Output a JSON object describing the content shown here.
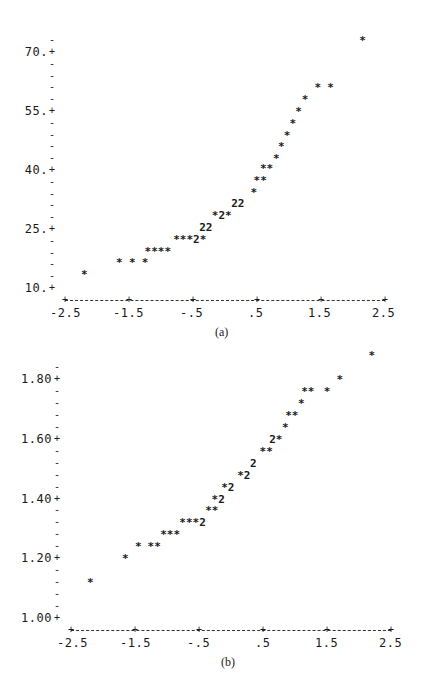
{
  "chart_data": [
    {
      "type": "scatter",
      "caption": "(a)",
      "title": "",
      "xlabel": "",
      "ylabel": "",
      "marker": "*",
      "x_ticks": [
        "-2.5",
        "-1.5",
        "-.5",
        ".5",
        "1.5",
        "2.5"
      ],
      "x_tick_values": [
        -2.5,
        -1.5,
        -0.5,
        0.5,
        1.5,
        2.5
      ],
      "y_ticks": [
        "70.",
        "55.",
        "40.",
        "25.",
        "10."
      ],
      "y_tick_values": [
        70,
        55,
        40,
        25,
        10
      ],
      "xlim": [
        -2.5,
        2.5
      ],
      "ylim": [
        7,
        76
      ],
      "grid": false,
      "legend": null,
      "note": "Character-plot (normal probability plot); '2' denotes two coincident points",
      "points": [
        {
          "x": -2.2,
          "y": 13.5,
          "glyph": "*"
        },
        {
          "x": -1.65,
          "y": 16.5,
          "glyph": "*"
        },
        {
          "x": -1.45,
          "y": 16.5,
          "glyph": "*"
        },
        {
          "x": -1.25,
          "y": 16.5,
          "glyph": "*"
        },
        {
          "x": -1.05,
          "y": 19.5,
          "glyph": "****"
        },
        {
          "x": -0.55,
          "y": 22.5,
          "glyph": "***2*"
        },
        {
          "x": -0.3,
          "y": 25.5,
          "glyph": "22"
        },
        {
          "x": -0.05,
          "y": 28.5,
          "glyph": "*2*"
        },
        {
          "x": 0.2,
          "y": 31.5,
          "glyph": "22"
        },
        {
          "x": 0.45,
          "y": 34.5,
          "glyph": "*"
        },
        {
          "x": 0.55,
          "y": 37.5,
          "glyph": "**"
        },
        {
          "x": 0.65,
          "y": 40.5,
          "glyph": "**"
        },
        {
          "x": 0.8,
          "y": 43.0,
          "glyph": "*"
        },
        {
          "x": 0.88,
          "y": 46.0,
          "glyph": "*"
        },
        {
          "x": 0.97,
          "y": 49.0,
          "glyph": "*"
        },
        {
          "x": 1.06,
          "y": 52.0,
          "glyph": "*"
        },
        {
          "x": 1.15,
          "y": 55.0,
          "glyph": "*"
        },
        {
          "x": 1.25,
          "y": 58.0,
          "glyph": "*"
        },
        {
          "x": 1.45,
          "y": 61.0,
          "glyph": "*"
        },
        {
          "x": 1.65,
          "y": 61.0,
          "glyph": "*"
        },
        {
          "x": 2.15,
          "y": 73.0,
          "glyph": "*"
        }
      ]
    },
    {
      "type": "scatter",
      "caption": "(b)",
      "title": "",
      "xlabel": "",
      "ylabel": "",
      "marker": "*",
      "x_ticks": [
        "-2.5",
        "-1.5",
        "-.5",
        ".5",
        "1.5",
        "2.5"
      ],
      "x_tick_values": [
        -2.5,
        -1.5,
        -0.5,
        0.5,
        1.5,
        2.5
      ],
      "y_ticks": [
        "1.80",
        "1.60",
        "1.40",
        "1.20",
        "1.00"
      ],
      "y_tick_values": [
        1.8,
        1.6,
        1.4,
        1.2,
        1.0
      ],
      "xlim": [
        -2.5,
        2.5
      ],
      "ylim": [
        0.96,
        1.88
      ],
      "grid": false,
      "legend": null,
      "note": "Character-plot (normal probability plot of transformed data); '2' denotes two coincident points",
      "points": [
        {
          "x": -2.2,
          "y": 1.12,
          "glyph": "*"
        },
        {
          "x": -1.65,
          "y": 1.2,
          "glyph": "*"
        },
        {
          "x": -1.45,
          "y": 1.24,
          "glyph": "*"
        },
        {
          "x": -1.2,
          "y": 1.24,
          "glyph": "**"
        },
        {
          "x": -0.95,
          "y": 1.28,
          "glyph": "***"
        },
        {
          "x": -0.6,
          "y": 1.32,
          "glyph": "***2"
        },
        {
          "x": -0.3,
          "y": 1.36,
          "glyph": "**"
        },
        {
          "x": -0.2,
          "y": 1.4,
          "glyph": "*2"
        },
        {
          "x": -0.05,
          "y": 1.44,
          "glyph": "*2"
        },
        {
          "x": 0.2,
          "y": 1.48,
          "glyph": "*2"
        },
        {
          "x": 0.35,
          "y": 1.52,
          "glyph": "2"
        },
        {
          "x": 0.55,
          "y": 1.56,
          "glyph": "**"
        },
        {
          "x": 0.7,
          "y": 1.6,
          "glyph": "2*"
        },
        {
          "x": 0.85,
          "y": 1.64,
          "glyph": "*"
        },
        {
          "x": 0.95,
          "y": 1.68,
          "glyph": "**"
        },
        {
          "x": 1.1,
          "y": 1.72,
          "glyph": "*"
        },
        {
          "x": 1.2,
          "y": 1.76,
          "glyph": "**"
        },
        {
          "x": 1.5,
          "y": 1.76,
          "glyph": "*"
        },
        {
          "x": 1.7,
          "y": 1.8,
          "glyph": "*"
        },
        {
          "x": 2.2,
          "y": 1.88,
          "glyph": "*"
        }
      ]
    }
  ]
}
